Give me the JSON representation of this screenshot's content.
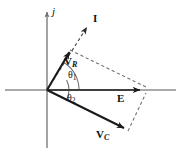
{
  "figure": {
    "width": 183,
    "height": 148,
    "background": "#ffffff"
  },
  "colors": {
    "axis": "#8c8c8c",
    "vector": "#1a1a1a",
    "dashed": "#6b6b6b",
    "arc": "#6b6b6b",
    "label": "#111111"
  },
  "axes": {
    "vertical": {
      "label": "j",
      "x": 47,
      "y_top": 10,
      "y_bottom": 148,
      "arrow": "up"
    },
    "horizontal": {
      "label": "",
      "y": 90,
      "x_left": 5,
      "x_right": 176,
      "arrow": "none"
    },
    "origin": {
      "x": 47,
      "y": 90
    }
  },
  "vectors": [
    {
      "name": "V_R",
      "label_main": "V",
      "label_sub": "R",
      "style": "solid",
      "from": {
        "x": 47,
        "y": 90
      },
      "to": {
        "x": 70,
        "y": 50
      }
    },
    {
      "name": "E",
      "label_main": "E",
      "label_sub": "",
      "style": "solid",
      "from": {
        "x": 47,
        "y": 90
      },
      "to": {
        "x": 144,
        "y": 90
      }
    },
    {
      "name": "V_C",
      "label_main": "V",
      "label_sub": "C",
      "style": "solid",
      "from": {
        "x": 47,
        "y": 90
      },
      "to": {
        "x": 128,
        "y": 131
      }
    },
    {
      "name": "I",
      "label_main": "I",
      "label_sub": "",
      "style": "dashed",
      "from": {
        "x": 47,
        "y": 90
      },
      "to": {
        "x": 90,
        "y": 22
      }
    }
  ],
  "construction_lines": [
    {
      "name": "vr-to-e",
      "from": {
        "x": 70,
        "y": 50
      },
      "to": {
        "x": 146,
        "y": 87
      }
    },
    {
      "name": "vc-to-e",
      "from": {
        "x": 128,
        "y": 131
      },
      "to": {
        "x": 146,
        "y": 92
      }
    }
  ],
  "angles": [
    {
      "name": "theta1",
      "label_main": "θ",
      "label_sub": "1",
      "radius": 30,
      "from_deg": 0,
      "to_deg": 60
    },
    {
      "name": "theta2",
      "label_main": "θ",
      "label_sub": "2",
      "radius": 20,
      "from_deg": -27,
      "to_deg": 0
    }
  ]
}
